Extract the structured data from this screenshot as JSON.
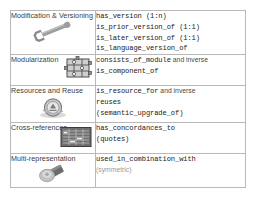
{
  "table": {
    "columns": [
      "category",
      "relations"
    ],
    "rows": [
      {
        "category": "Modification & Versioning",
        "icon": "wrench-icon",
        "lines": [
          [
            {
              "t": "has_version (1:n)",
              "s": "mono"
            }
          ],
          [
            {
              "t": "is_prior_version_of (1:1)",
              "s": "mono"
            }
          ],
          [
            {
              "t": "is_later_version_of (1:1)",
              "s": "mono"
            }
          ],
          [
            {
              "t": "is_language_version_of",
              "s": "mono"
            }
          ]
        ]
      },
      {
        "category": "Modularization",
        "icon": "puzzle-pieces-icon",
        "lines": [
          [
            {
              "t": "consists_of_module",
              "s": "mono"
            },
            {
              "t": "and inverse",
              "s": "plain"
            }
          ],
          [
            {
              "t": "is_component_of",
              "s": "mono"
            }
          ]
        ]
      },
      {
        "category": "Resources and Reuse",
        "icon": "recycle-coin-icon",
        "lines": [
          [
            {
              "t": "is_resource_for",
              "s": "mono"
            },
            {
              "t": "and inverse",
              "s": "plain"
            }
          ],
          [
            {
              "t": "reuses",
              "s": "mono"
            }
          ],
          [
            {
              "t": "(semantic_upgrade_of)",
              "s": "mono"
            }
          ]
        ]
      },
      {
        "category": "Cross-references",
        "icon": "document-grid-icon",
        "lines": [
          [
            {
              "t": "has_concordances_to",
              "s": "mono"
            }
          ],
          [
            {
              "t": "(quotes)",
              "s": "mono"
            }
          ]
        ]
      },
      {
        "category": "Multi-representation",
        "icon": "stacked-objects-icon",
        "lines": [
          [
            {
              "t": "used_in_combination_with",
              "s": "mono"
            }
          ],
          [
            {
              "t": "(symmetric)",
              "s": "plain-dim"
            }
          ]
        ]
      }
    ]
  },
  "colors": {
    "border": "#b9b9b9",
    "text": "#3a3a3a",
    "mono_text": "#222222",
    "dim_text": "#9a9a9a",
    "icon_grey": "#9b9b9b",
    "icon_dark": "#5a5a5a",
    "background": "#ffffff"
  }
}
